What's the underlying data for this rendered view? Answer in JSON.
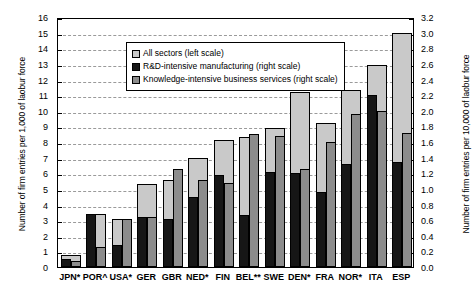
{
  "chart_data": {
    "type": "bar",
    "title": "",
    "categories": [
      "JPN*",
      "POR^",
      "USA*",
      "GER",
      "GBR",
      "NED*",
      "FIN",
      "BEL**",
      "SWE",
      "DEN*",
      "FRA",
      "NOR*",
      "ITA",
      "ESP"
    ],
    "series": [
      {
        "name": "All sectors (left scale)",
        "axis": "left",
        "color": "#c9c9c9",
        "values": [
          0.8,
          3.4,
          3.1,
          5.3,
          5.6,
          7.0,
          8.1,
          8.3,
          8.9,
          11.2,
          9.2,
          11.3,
          12.9,
          15.0
        ]
      },
      {
        "name": "R&D-intensive manufacturing (right scale)",
        "axis": "right",
        "color": "#161616",
        "values": [
          0.1,
          0.68,
          0.28,
          0.64,
          0.62,
          0.9,
          1.18,
          0.66,
          1.22,
          1.2,
          0.96,
          1.32,
          2.2,
          1.34
        ]
      },
      {
        "name": "Knowledge-intensive business services (right scale)",
        "axis": "right",
        "color": "#8c8c8c",
        "values": [
          0.08,
          0.26,
          0.62,
          0.64,
          1.26,
          1.12,
          1.08,
          1.7,
          1.68,
          1.26,
          1.6,
          1.96,
          2.0,
          1.72
        ]
      }
    ],
    "xlabel": "",
    "ylabel_left": "Number of firm entries per 1,000 of laobur force",
    "ylabel_right": "Number of firm entries per 10,000 of laobur force",
    "ylim_left": [
      0,
      16
    ],
    "ylim_right": [
      0.0,
      3.2
    ],
    "yticks_left": [
      "0",
      "1",
      "2",
      "3",
      "4",
      "5",
      "6",
      "7",
      "8",
      "9",
      "10",
      "11",
      "12",
      "13",
      "14",
      "15",
      "16"
    ],
    "yticks_right": [
      "0.0",
      "0.2",
      "0.4",
      "0.6",
      "0.8",
      "1.0",
      "1.2",
      "1.4",
      "1.6",
      "1.8",
      "2.0",
      "2.2",
      "2.4",
      "2.6",
      "2.8",
      "3.0",
      "3.2"
    ],
    "grid": true,
    "legend_position": "top-left"
  }
}
